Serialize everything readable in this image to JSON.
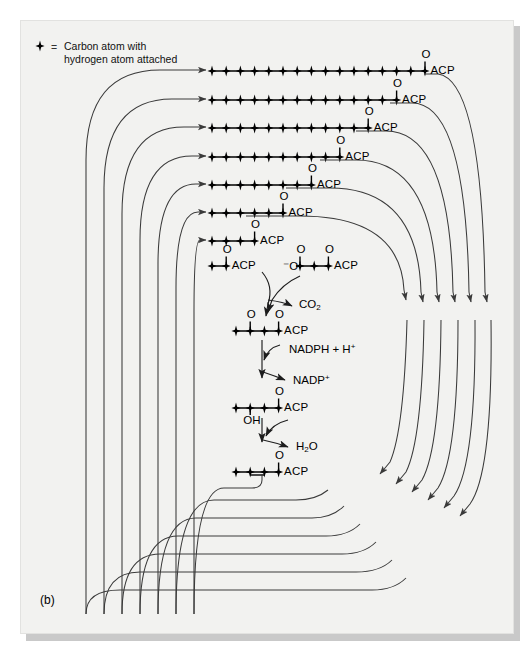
{
  "figure": {
    "panel_label": "(b)",
    "legend": {
      "marker_icon": "carbon-atom-marker",
      "equals": "=",
      "line1": "Carbon atom with",
      "line2": "hydrogen atom attached"
    },
    "background_color": "#f2f2f0",
    "ink_color": "#000000",
    "arrow_color": "#3a3a3a",
    "shadow_color": "#c9c9c9"
  },
  "acyl_chains": {
    "acp_label": "ACP",
    "oxygen_label": "O",
    "rows": [
      {
        "name": "palmitoyl-ACP",
        "carbons": 16,
        "x_start": 212,
        "y": 71,
        "terminal_label": "ACP"
      },
      {
        "name": "myristoyl-ACP",
        "carbons": 14,
        "x_start": 212,
        "y": 100,
        "terminal_label": "ACP"
      },
      {
        "name": "lauroyl-ACP",
        "carbons": 12,
        "x_start": 212,
        "y": 128,
        "terminal_label": "ACP"
      },
      {
        "name": "decanoyl-ACP",
        "carbons": 10,
        "x_start": 212,
        "y": 157,
        "terminal_label": "ACP"
      },
      {
        "name": "octanoyl-ACP",
        "carbons": 8,
        "x_start": 212,
        "y": 185,
        "terminal_label": "ACP"
      },
      {
        "name": "hexanoyl-ACP",
        "carbons": 6,
        "x_start": 212,
        "y": 213,
        "terminal_label": "ACP"
      },
      {
        "name": "butyryl-ACP-top",
        "carbons": 4,
        "x_start": 212,
        "y": 241,
        "terminal_label": "ACP"
      }
    ]
  },
  "cycle": {
    "acetyl": {
      "name": "acetyl-ACP",
      "carbons": 2,
      "x_start": 212,
      "y": 266,
      "terminal_label": "ACP",
      "oxygen_label": "O"
    },
    "malonyl": {
      "name": "malonyl-ACP",
      "carbons": 3,
      "x_start": 300,
      "y": 266,
      "terminal_label": "ACP",
      "leading_label": "⁻O",
      "oxygen_label": "O"
    },
    "acetoacetyl": {
      "name": "acetoacetyl-ACP",
      "carbons": 4,
      "x_start": 236,
      "y": 331,
      "terminal_label": "ACP",
      "oxygen_label": "O"
    },
    "hydroxybutyryl": {
      "name": "beta-hydroxybutyryl-ACP",
      "carbons": 4,
      "x_start": 236,
      "y": 408,
      "terminal_label": "ACP",
      "oxygen_label": "O",
      "hydroxyl_label": "OH"
    },
    "crotonyl": {
      "name": "crotonyl-ACP",
      "carbons": 4,
      "x_start": 236,
      "y": 472,
      "terminal_label": "ACP",
      "oxygen_label": "O"
    },
    "byproducts": [
      {
        "name": "carbon-dioxide",
        "label": "CO",
        "subscript": "2",
        "x": 299,
        "y": 305
      },
      {
        "name": "nadph-hydrogen",
        "label": "NADPH + H",
        "superscript": "+",
        "x": 285,
        "y": 350
      },
      {
        "name": "nadp-plus",
        "label": "NADP",
        "superscript": "+",
        "x": 293,
        "y": 380
      },
      {
        "name": "water",
        "label": "H",
        "subscript": "2",
        "label_tail": "O",
        "x": 296,
        "y": 447
      }
    ]
  },
  "arrows": {
    "left_feed_count": 7,
    "right_return_count": 6,
    "bottom_loop_count": 7,
    "note_left": "recycling arrows entering each acyl chain from the left",
    "note_right": "elongation arrows leaving each acyl chain to the right"
  }
}
